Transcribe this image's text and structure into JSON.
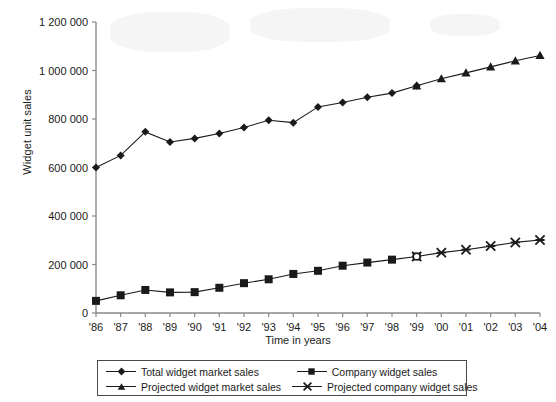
{
  "chart_data": {
    "type": "line",
    "title": "",
    "xlabel": "Time in years",
    "ylabel": "Widget unit sales",
    "x": [
      "'86",
      "'87",
      "'88",
      "'89",
      "'90",
      "'91",
      "'92",
      "'93",
      "'94",
      "'95",
      "'96",
      "'97",
      "'98",
      "'99",
      "'00",
      "'01",
      "'02",
      "'03",
      "'04"
    ],
    "ylim": [
      0,
      1200000
    ],
    "yticks": [
      0,
      200000,
      400000,
      600000,
      800000,
      1000000,
      1200000
    ],
    "ytick_labels": [
      "0",
      "200 000",
      "400 000",
      "600 000",
      "800 000",
      "1 000 000",
      "1 200 000"
    ],
    "grid": false,
    "legend_position": "below-plot",
    "series": [
      {
        "name": "Total widget market sales",
        "marker": "diamond",
        "color": "#1a1a1a",
        "x": [
          "'86",
          "'87",
          "'88",
          "'89",
          "'90",
          "'91",
          "'92",
          "'93",
          "'94",
          "'95",
          "'96",
          "'97",
          "'98",
          "'99"
        ],
        "values": [
          600000,
          650000,
          747000,
          705000,
          720000,
          740000,
          765000,
          795000,
          785000,
          850000,
          868000,
          890000,
          907000,
          937000
        ]
      },
      {
        "name": "Projected widget market sales",
        "marker": "triangle",
        "color": "#1a1a1a",
        "x": [
          "'99",
          "'00",
          "'01",
          "'02",
          "'03",
          "'04"
        ],
        "values": [
          937000,
          966000,
          990000,
          1015000,
          1040000,
          1062000
        ]
      },
      {
        "name": "Company widget sales",
        "marker": "square",
        "color": "#1a1a1a",
        "x": [
          "'86",
          "'87",
          "'88",
          "'89",
          "'90",
          "'91",
          "'92",
          "'93",
          "'94",
          "'95",
          "'96",
          "'97",
          "'98",
          "'99"
        ],
        "values": [
          50000,
          73000,
          95000,
          85000,
          86000,
          104000,
          123000,
          139000,
          161000,
          174000,
          195000,
          208000,
          220000,
          233000
        ]
      },
      {
        "name": "Projected company widget sales",
        "marker": "x",
        "color": "#1a1a1a",
        "x": [
          "'99",
          "'00",
          "'01",
          "'02",
          "'03",
          "'04"
        ],
        "values": [
          233000,
          249000,
          261000,
          276000,
          291000,
          301000
        ]
      }
    ]
  },
  "axes": {
    "y_title": "Widget unit sales",
    "x_title": "Time in years"
  },
  "legend": {
    "entries": [
      {
        "label": "Total widget market sales",
        "marker": "diamond"
      },
      {
        "label": "Company widget sales",
        "marker": "square"
      },
      {
        "label": "Projected widget market sales",
        "marker": "triangle"
      },
      {
        "label": "Projected company widget sales",
        "marker": "x"
      }
    ]
  }
}
